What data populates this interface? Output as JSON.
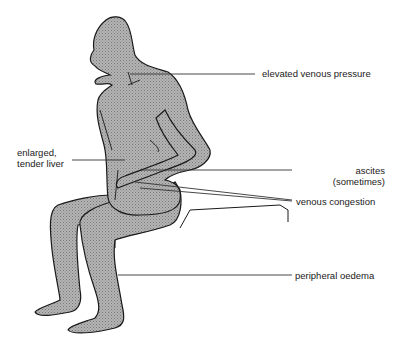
{
  "diagram": {
    "labels": {
      "elevated_venous_pressure": "elevated venous pressure",
      "liver_line1": "enlarged,",
      "liver_line2": "tender liver",
      "ascites_line1": "ascites",
      "ascites_line2": "(sometimes)",
      "venous_congestion": "venous congestion",
      "peripheral_oedema": "peripheral oedema"
    },
    "colors": {
      "figure_fill": "#a8a8a8",
      "outline": "#1a1a1a",
      "leader_line": "#333333"
    }
  }
}
